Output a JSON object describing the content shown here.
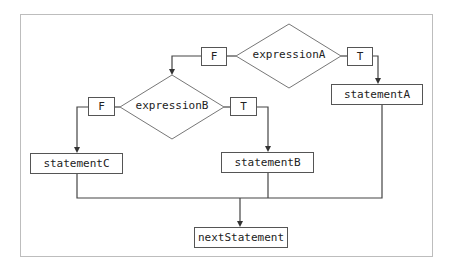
{
  "diagram": {
    "type": "flowchart",
    "decisions": [
      {
        "id": "A",
        "label": "expressionA",
        "true_label": "T",
        "false_label": "F"
      },
      {
        "id": "B",
        "label": "expressionB",
        "true_label": "T",
        "false_label": "F"
      }
    ],
    "statements": {
      "a": "statementA",
      "b": "statementB",
      "c": "statementC",
      "next": "nextStatement"
    },
    "edges": [
      {
        "from": "expressionA",
        "to": "statementA",
        "label": "T"
      },
      {
        "from": "expressionA",
        "to": "expressionB",
        "label": "F"
      },
      {
        "from": "expressionB",
        "to": "statementB",
        "label": "T"
      },
      {
        "from": "expressionB",
        "to": "statementC",
        "label": "F"
      },
      {
        "from": "statementA",
        "to": "nextStatement"
      },
      {
        "from": "statementB",
        "to": "nextStatement"
      },
      {
        "from": "statementC",
        "to": "nextStatement"
      }
    ],
    "colors": {
      "line": "#444444",
      "frame": "#bdbdbd",
      "diamond": "#777777"
    }
  }
}
